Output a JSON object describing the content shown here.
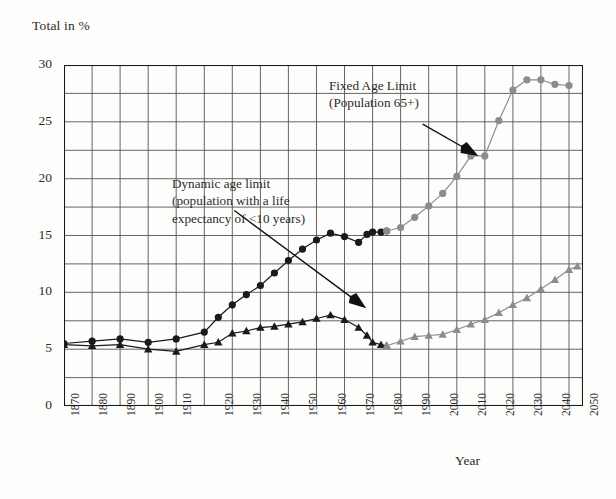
{
  "chart_data": {
    "type": "line",
    "title": "",
    "ylabel": "Total in %",
    "xlabel": "Year",
    "ylim": [
      0,
      30
    ],
    "ytick_step": 5,
    "ygrid_step": 2.5,
    "xlim": [
      1870,
      2055
    ],
    "grid": true,
    "legend_position": "annotations",
    "yticks": [
      "0",
      "5",
      "10",
      "15",
      "20",
      "25",
      "30"
    ],
    "xticks": [
      "1870",
      "1880",
      "1890",
      "1900",
      "1910",
      "",
      "",
      "1920",
      "1930",
      "1940",
      "1950",
      "1960",
      "1970",
      "1980",
      "1990",
      "2000",
      "2010",
      "2020",
      "2030",
      "2040",
      "2050"
    ],
    "xtick_years": [
      1870,
      1880,
      1890,
      1900,
      1910,
      1915,
      1920,
      1925,
      1935,
      1945,
      1955,
      1965,
      1975,
      1985,
      1995,
      2005,
      2015,
      2025,
      2035,
      2045,
      2055
    ],
    "annotations": [
      {
        "id": "fixed",
        "text": "Fixed Age Limit\n(Population 65+)",
        "arrow": "down-right"
      },
      {
        "id": "dynamic",
        "text": "Dynamic age limit\n(population with a life\nexpectancy of <10 years)",
        "arrow": "down-right"
      }
    ],
    "colors": {
      "historic": "#1a1a1a",
      "projection": "#8c8c8c",
      "grid": "#555555",
      "axis": "#1a1a1a"
    },
    "series": [
      {
        "name": "Fixed Age Limit (Population 65+)",
        "marker": "circle",
        "phase": "historic",
        "color": "#1a1a1a",
        "points": [
          [
            1870,
            5.5
          ],
          [
            1880,
            5.7
          ],
          [
            1890,
            5.9
          ],
          [
            1900,
            5.6
          ],
          [
            1910,
            5.9
          ],
          [
            1920,
            6.5
          ],
          [
            1925,
            7.8
          ],
          [
            1930,
            8.9
          ],
          [
            1935,
            9.8
          ],
          [
            1940,
            10.6
          ],
          [
            1945,
            11.7
          ],
          [
            1950,
            12.8
          ],
          [
            1955,
            13.8
          ],
          [
            1960,
            14.6
          ],
          [
            1965,
            15.2
          ],
          [
            1970,
            14.9
          ],
          [
            1975,
            14.4
          ],
          [
            1978,
            15.1
          ],
          [
            1980,
            15.3
          ],
          [
            1983,
            15.3
          ],
          [
            1985,
            15.4
          ]
        ]
      },
      {
        "name": "Fixed Age Limit (Population 65+) — projection",
        "marker": "circle",
        "phase": "projection",
        "color": "#8c8c8c",
        "points": [
          [
            1985,
            15.4
          ],
          [
            1990,
            15.7
          ],
          [
            1995,
            16.6
          ],
          [
            2000,
            17.6
          ],
          [
            2005,
            18.7
          ],
          [
            2010,
            20.2
          ],
          [
            2015,
            22.0
          ],
          [
            2020,
            22.0
          ],
          [
            2025,
            25.1
          ],
          [
            2030,
            27.8
          ],
          [
            2035,
            28.7
          ],
          [
            2040,
            28.7
          ],
          [
            2045,
            28.3
          ],
          [
            2050,
            28.2
          ]
        ]
      },
      {
        "name": "Dynamic age limit (population with a life expectancy of <10 years)",
        "marker": "triangle",
        "phase": "historic",
        "color": "#1a1a1a",
        "points": [
          [
            1870,
            5.4
          ],
          [
            1880,
            5.3
          ],
          [
            1890,
            5.4
          ],
          [
            1900,
            5.0
          ],
          [
            1910,
            4.8
          ],
          [
            1920,
            5.4
          ],
          [
            1925,
            5.6
          ],
          [
            1930,
            6.4
          ],
          [
            1935,
            6.6
          ],
          [
            1940,
            6.9
          ],
          [
            1945,
            7.0
          ],
          [
            1950,
            7.2
          ],
          [
            1955,
            7.4
          ],
          [
            1960,
            7.7
          ],
          [
            1965,
            8.0
          ],
          [
            1970,
            7.6
          ],
          [
            1975,
            6.9
          ],
          [
            1978,
            6.2
          ],
          [
            1980,
            5.6
          ],
          [
            1983,
            5.4
          ],
          [
            1985,
            5.3
          ]
        ]
      },
      {
        "name": "Dynamic age limit — projection",
        "marker": "triangle",
        "phase": "projection",
        "color": "#8c8c8c",
        "points": [
          [
            1985,
            5.3
          ],
          [
            1990,
            5.7
          ],
          [
            1995,
            6.1
          ],
          [
            2000,
            6.2
          ],
          [
            2005,
            6.3
          ],
          [
            2010,
            6.7
          ],
          [
            2015,
            7.2
          ],
          [
            2020,
            7.6
          ],
          [
            2025,
            8.2
          ],
          [
            2030,
            8.9
          ],
          [
            2035,
            9.5
          ],
          [
            2040,
            10.3
          ],
          [
            2045,
            11.1
          ],
          [
            2050,
            12.0
          ],
          [
            2053,
            12.3
          ]
        ]
      }
    ]
  }
}
